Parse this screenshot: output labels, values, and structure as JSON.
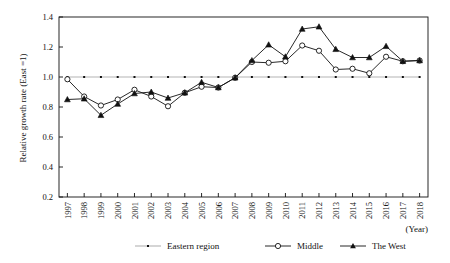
{
  "chart_data": {
    "type": "line",
    "title": "",
    "xlabel": "(Year)",
    "ylabel": "Relative growth rate (East =1)",
    "x": [
      1997,
      1998,
      1999,
      2000,
      2001,
      2002,
      2003,
      2004,
      2005,
      2006,
      2007,
      2008,
      2009,
      2010,
      2011,
      2012,
      2013,
      2014,
      2015,
      2016,
      2017,
      2018
    ],
    "xtick_labels": [
      "1997",
      "1998",
      "1999",
      "2000",
      "2001",
      "2002",
      "2003",
      "2004",
      "2005",
      "2006",
      "2007",
      "2008",
      "2009",
      "2010",
      "2011",
      "2012",
      "2013",
      "2014",
      "2015",
      "2016",
      "2017",
      "2018"
    ],
    "ytick_labels": [
      "0.2",
      "0.4",
      "0.6",
      "0.8",
      "1.0",
      "1.2",
      "1.4"
    ],
    "ytick_values": [
      0.2,
      0.4,
      0.6,
      0.8,
      1.0,
      1.2,
      1.4
    ],
    "ylim": [
      0.2,
      1.4
    ],
    "grid": false,
    "legend_position": "bottom",
    "series": [
      {
        "name": "Eastern region",
        "marker": "small-dot",
        "color": "#b3b3b3",
        "values": [
          1.0,
          1.0,
          1.0,
          1.0,
          1.0,
          1.0,
          1.0,
          1.0,
          1.0,
          1.0,
          1.0,
          1.0,
          1.0,
          1.0,
          1.0,
          1.0,
          1.0,
          1.0,
          1.0,
          1.0,
          1.0,
          1.0
        ]
      },
      {
        "name": "Middle",
        "marker": "open-circle",
        "color": "#111111",
        "values": [
          0.985,
          0.87,
          0.81,
          0.85,
          0.915,
          0.87,
          0.805,
          0.895,
          0.935,
          0.93,
          0.995,
          1.1,
          1.095,
          1.105,
          1.21,
          1.175,
          1.05,
          1.055,
          1.025,
          1.135,
          1.105,
          1.11
        ]
      },
      {
        "name": "The West",
        "marker": "filled-triangle",
        "color": "#111111",
        "values": [
          0.85,
          0.855,
          0.745,
          0.82,
          0.89,
          0.9,
          0.86,
          0.895,
          0.965,
          0.93,
          0.995,
          1.11,
          1.215,
          1.135,
          1.32,
          1.335,
          1.185,
          1.13,
          1.13,
          1.205,
          1.105,
          1.11
        ]
      }
    ]
  },
  "legend": {
    "items": [
      {
        "label": "Eastern region",
        "marker": "small-dot",
        "color": "#b3b3b3"
      },
      {
        "label": "Middle",
        "marker": "open-circle",
        "color": "#111111"
      },
      {
        "label": "The West",
        "marker": "filled-triangle",
        "color": "#111111"
      }
    ]
  }
}
